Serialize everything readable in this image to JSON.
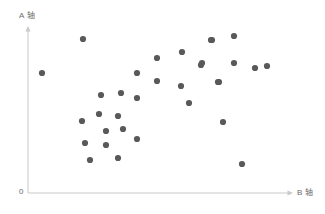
{
  "chart_data": {
    "type": "scatter",
    "title": "",
    "xlabel": "B 轴",
    "ylabel": "A 轴",
    "origin_label": "0",
    "grid": false,
    "legend": null,
    "axis_style": {
      "arrow_heads": true,
      "axis_color": "#c9c9c9",
      "point_color": "#595959",
      "point_radius": 3.1
    },
    "xlim": [
      0,
      292
    ],
    "ylim": [
      0,
      193
    ],
    "x_axis_pixel": {
      "start": 28,
      "end": 292,
      "y": 193
    },
    "y_axis_pixel": {
      "x": 28,
      "bottom": 193,
      "top": 27
    },
    "n_points": 33,
    "points": [
      {
        "x": 42,
        "y": 73
      },
      {
        "x": 83,
        "y": 39
      },
      {
        "x": 82,
        "y": 121
      },
      {
        "x": 99,
        "y": 114
      },
      {
        "x": 85,
        "y": 143
      },
      {
        "x": 90,
        "y": 160
      },
      {
        "x": 101,
        "y": 95
      },
      {
        "x": 106,
        "y": 131
      },
      {
        "x": 106,
        "y": 145
      },
      {
        "x": 118,
        "y": 116
      },
      {
        "x": 118,
        "y": 158
      },
      {
        "x": 121,
        "y": 93
      },
      {
        "x": 123,
        "y": 129
      },
      {
        "x": 137,
        "y": 73
      },
      {
        "x": 137,
        "y": 98
      },
      {
        "x": 137,
        "y": 139
      },
      {
        "x": 157,
        "y": 58
      },
      {
        "x": 157,
        "y": 81
      },
      {
        "x": 181,
        "y": 86
      },
      {
        "x": 182,
        "y": 52
      },
      {
        "x": 189,
        "y": 103
      },
      {
        "x": 201,
        "y": 65
      },
      {
        "x": 202,
        "y": 63
      },
      {
        "x": 211,
        "y": 40
      },
      {
        "x": 212,
        "y": 40
      },
      {
        "x": 218,
        "y": 82
      },
      {
        "x": 219,
        "y": 82
      },
      {
        "x": 223,
        "y": 122
      },
      {
        "x": 234,
        "y": 36
      },
      {
        "x": 234,
        "y": 63
      },
      {
        "x": 242,
        "y": 164
      },
      {
        "x": 255,
        "y": 68
      },
      {
        "x": 267,
        "y": 66
      }
    ]
  }
}
